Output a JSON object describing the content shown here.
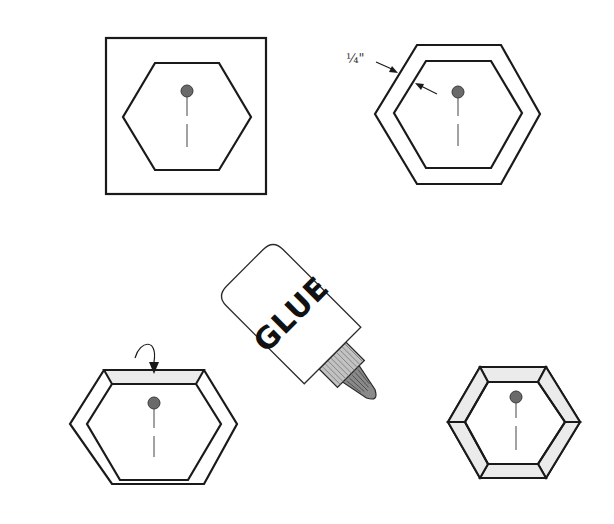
{
  "diagram": {
    "colors": {
      "stroke": "#1a1a1a",
      "strip_fill": "#ebebeb",
      "pin_head": "#6a6a6a",
      "pin_line": "#7a7a7a",
      "glue_nozzle": "#8a8a8a",
      "glue_cap": "#b5b5b5"
    },
    "steps": [
      {
        "id": "step-1",
        "caption": "",
        "elements": [
          "square-paper",
          "hexagon-template",
          "pin"
        ]
      },
      {
        "id": "step-2",
        "caption": "",
        "elements": [
          "outer-hexagon",
          "inner-hexagon",
          "seam-allowance-label",
          "pin"
        ]
      },
      {
        "id": "step-3",
        "caption": "",
        "elements": [
          "outer-hexagon",
          "inner-hexagon",
          "folded-top-edge",
          "fold-arrow",
          "glue-bottle",
          "pin"
        ]
      },
      {
        "id": "step-4",
        "caption": "",
        "elements": [
          "outer-hexagon",
          "inner-hexagon",
          "folded-edges-all",
          "pin"
        ]
      }
    ],
    "labels": {
      "seam_allowance": "¼\"",
      "glue_bottle": "GLUE"
    },
    "icons": {
      "pin": "pin-icon",
      "glue": "glue-bottle-icon",
      "fold_arrow": "curved-arrow-icon"
    }
  }
}
